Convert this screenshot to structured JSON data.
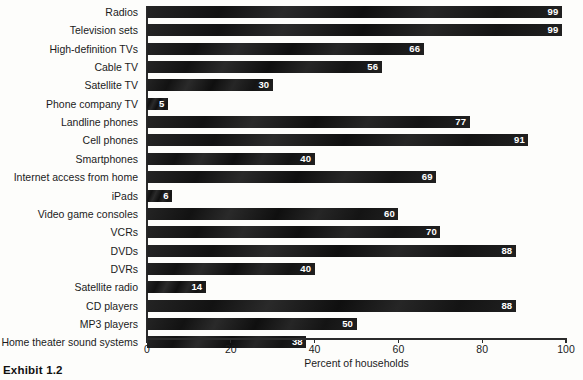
{
  "chart_data": {
    "type": "bar",
    "orientation": "horizontal",
    "title": "",
    "xlabel": "Percent of households",
    "ylabel": "",
    "xlim": [
      0,
      100
    ],
    "xticks": [
      0,
      20,
      40,
      60,
      80,
      100
    ],
    "grid": false,
    "legend": null,
    "bar_color": "#161616",
    "value_label_color": "#ffffff",
    "categories": [
      "Radios",
      "Television sets",
      "High-definition TVs",
      "Cable TV",
      "Satellite TV",
      "Phone company TV",
      "Landline phones",
      "Cell phones",
      "Smartphones",
      "Internet access from home",
      "iPads",
      "Video game consoles",
      "VCRs",
      "DVDs",
      "DVRs",
      "Satellite radio",
      "CD players",
      "MP3 players",
      "Home theater sound systems"
    ],
    "values": [
      99,
      99,
      66,
      56,
      30,
      5,
      77,
      91,
      40,
      69,
      6,
      60,
      70,
      88,
      40,
      14,
      88,
      50,
      38
    ]
  },
  "caption": {
    "exhibit_label": "Exhibit 1.2"
  }
}
